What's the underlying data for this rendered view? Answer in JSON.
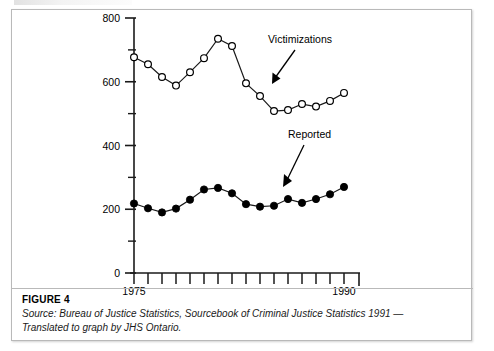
{
  "figure": {
    "number_label": "FIGURE 4",
    "source_line_1": "Source: Bureau of Justice Statistics, Sourcebook of Criminal Justice Statistics 1991 —",
    "source_line_2": "Translated to graph by JHS Ontario."
  },
  "axes": {
    "y_tick_800": "800",
    "y_tick_600": "600",
    "y_tick_400": "400",
    "y_tick_200": "200",
    "y_tick_0": "0",
    "x_tick_first": "1975",
    "x_tick_last": "1990"
  },
  "annotations": {
    "victimizations_label": "Victimizations",
    "reported_label": "Reported"
  },
  "colors": {
    "axis": "#1a1a1a",
    "line": "#1a1a1a",
    "marker_open_fill": "#ffffff",
    "marker_closed_fill": "#000000",
    "card_border": "#b9b9b9",
    "background": "#ffffff"
  },
  "chart_data": {
    "type": "line",
    "title": "",
    "xlabel": "",
    "ylabel": "",
    "xlim": [
      1975,
      1990
    ],
    "ylim": [
      0,
      800
    ],
    "y_major_ticks": [
      0,
      200,
      400,
      600,
      800
    ],
    "y_minor_ticks": [
      100,
      300,
      500,
      700
    ],
    "x_labeled_ticks": [
      1975,
      1990
    ],
    "grid": false,
    "legend": "annotations-with-arrows",
    "x": [
      1975,
      1976,
      1977,
      1978,
      1979,
      1980,
      1981,
      1982,
      1983,
      1984,
      1985,
      1986,
      1987,
      1988,
      1989,
      1990
    ],
    "series": [
      {
        "name": "Victimizations",
        "marker": "open-circle",
        "values": [
          677,
          655,
          615,
          588,
          630,
          674,
          735,
          712,
          595,
          555,
          508,
          511,
          530,
          522,
          540,
          565
        ]
      },
      {
        "name": "Reported",
        "marker": "filled-circle",
        "values": [
          218,
          203,
          190,
          202,
          230,
          262,
          267,
          250,
          216,
          208,
          211,
          232,
          220,
          232,
          247,
          270
        ]
      }
    ]
  }
}
